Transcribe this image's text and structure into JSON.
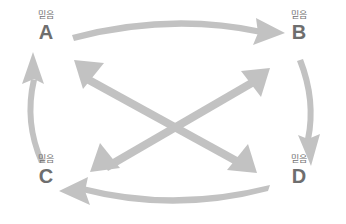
{
  "diagram": {
    "type": "cycle-with-crossed-bidirectional-diagram",
    "background_color": "#ffffff",
    "arrow_color": "#c2c2c2",
    "letter_color": "#6e6e6e",
    "sublabel_color": "#6f6f6f",
    "nodes": [
      {
        "id": "a",
        "letter": "A",
        "sublabel": "믿음",
        "position": "top-left"
      },
      {
        "id": "b",
        "letter": "B",
        "sublabel": "믿음",
        "position": "top-right"
      },
      {
        "id": "c",
        "letter": "C",
        "sublabel": "믿음",
        "position": "bottom-left"
      },
      {
        "id": "d",
        "letter": "D",
        "sublabel": "믿음",
        "position": "bottom-right"
      }
    ],
    "arrows": [
      {
        "id": "a-to-b",
        "from": "A",
        "to": "B",
        "style": "curved",
        "heads": "single",
        "direction": "right"
      },
      {
        "id": "b-to-d",
        "from": "B",
        "to": "D",
        "style": "curved",
        "heads": "single",
        "direction": "down"
      },
      {
        "id": "d-to-c",
        "from": "D",
        "to": "C",
        "style": "curved",
        "heads": "single",
        "direction": "left"
      },
      {
        "id": "c-to-a",
        "from": "C",
        "to": "A",
        "style": "curved",
        "heads": "single",
        "direction": "up"
      },
      {
        "id": "a-and-d",
        "from": "A",
        "to": "D",
        "style": "straight",
        "heads": "double",
        "direction": "diagonal"
      },
      {
        "id": "b-and-c",
        "from": "B",
        "to": "C",
        "style": "straight",
        "heads": "double",
        "direction": "diagonal"
      }
    ]
  }
}
